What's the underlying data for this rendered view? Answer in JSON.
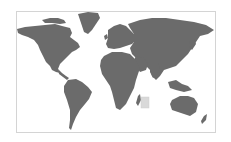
{
  "map": {
    "type": "world-map",
    "land_color": "#6b6b6b",
    "background_color": "#ffffff",
    "border_color": "#d4d4d4",
    "highlight": {
      "region": "indian-ocean-square",
      "color": "#d9d9d9"
    },
    "continents": [
      "North America",
      "Greenland",
      "South America",
      "Europe",
      "Africa",
      "Asia",
      "Australia",
      "New Zealand",
      "Madagascar"
    ]
  }
}
